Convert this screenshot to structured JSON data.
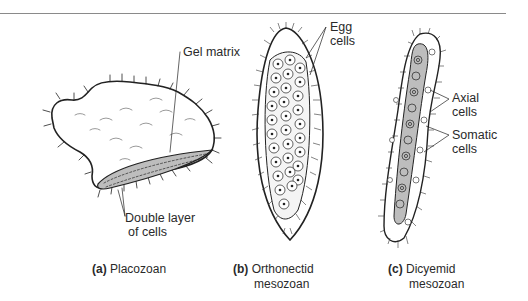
{
  "figure": {
    "panels": [
      {
        "id": "a",
        "letter": "(a)",
        "caption_line1": "Placozoan",
        "caption_line2": "",
        "labels": [
          "Gel matrix",
          "Double layer",
          "of cells"
        ]
      },
      {
        "id": "b",
        "letter": "(b)",
        "caption_line1": "Orthonectid",
        "caption_line2": "mesozoan",
        "labels": [
          "Egg",
          "cells"
        ]
      },
      {
        "id": "c",
        "letter": "(c)",
        "caption_line1": "Dicyemid",
        "caption_line2": "mesozoan",
        "labels": [
          "Axial",
          "cells",
          "Somatic",
          "cells"
        ]
      }
    ],
    "colors": {
      "line": "#222222",
      "shade": "#bdbdbd",
      "rule": "#8a8a8a"
    }
  }
}
